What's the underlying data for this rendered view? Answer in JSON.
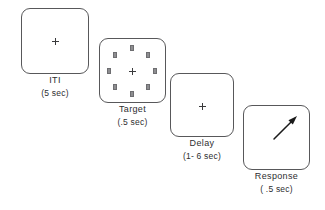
{
  "figure": {
    "background_color": "#ffffff",
    "outline_color": "#58585a",
    "text_color": "#2e2e30",
    "square_fill_color": "#8d8d90",
    "arrow_color": "#1a1a1a"
  },
  "panels": [
    {
      "id": "iti",
      "name": "ITI",
      "duration": "(5 sec)",
      "box": {
        "x": 21,
        "y": 8,
        "w": 68,
        "h": 66
      },
      "caption": {
        "x": 21,
        "y": 76,
        "w": 68
      },
      "fixation": {
        "x": 55,
        "y": 41
      },
      "targets": [],
      "arrow": null
    },
    {
      "id": "target",
      "name": "Target",
      "duration": "(.5 sec)",
      "box": {
        "x": 99,
        "y": 38,
        "w": 67,
        "h": 65
      },
      "caption": {
        "x": 99,
        "y": 105,
        "w": 67
      },
      "fixation": {
        "x": 132,
        "y": 71
      },
      "targets": [
        {
          "x": 132,
          "y": 48
        },
        {
          "x": 148,
          "y": 55
        },
        {
          "x": 155,
          "y": 71
        },
        {
          "x": 148,
          "y": 87
        },
        {
          "x": 132,
          "y": 94
        },
        {
          "x": 115,
          "y": 87
        },
        {
          "x": 109,
          "y": 71
        },
        {
          "x": 115,
          "y": 55
        }
      ],
      "arrow": null
    },
    {
      "id": "delay",
      "name": "Delay",
      "duration": "(1- 6 sec)",
      "box": {
        "x": 170,
        "y": 73,
        "w": 64,
        "h": 64
      },
      "caption": {
        "x": 170,
        "y": 139,
        "w": 64
      },
      "fixation": {
        "x": 202,
        "y": 106
      },
      "targets": [],
      "arrow": null
    },
    {
      "id": "response",
      "name": "Response",
      "duration": "( .5 sec)",
      "box": {
        "x": 243,
        "y": 105,
        "w": 67,
        "h": 65
      },
      "caption": {
        "x": 243,
        "y": 172,
        "w": 67
      },
      "fixation": null,
      "targets": [],
      "arrow": {
        "x1": 274,
        "y1": 139,
        "x2": 297,
        "y2": 116,
        "direction": "up-right"
      }
    }
  ]
}
